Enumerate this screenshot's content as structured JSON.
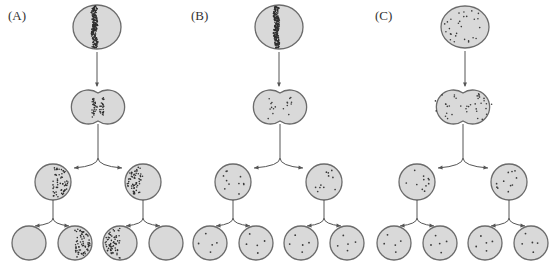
{
  "figure": {
    "panels": [
      {
        "label": "(A)",
        "label_pos": [
          8,
          20
        ],
        "distribution": "concentrated band that stays asymmetric",
        "top_cell": {
          "cx": 97,
          "cy": 27,
          "rx": 24,
          "ry": 22,
          "pattern": "vertical-band"
        },
        "dividing_cell": {
          "cx": 98,
          "cy": 107,
          "lobe_offset": 15,
          "r": 17,
          "pattern": "center-band-scattered"
        },
        "row3": [
          {
            "cx": 53,
            "cy": 182,
            "r": 18,
            "pattern": "right-half-dense"
          },
          {
            "cx": 143,
            "cy": 182,
            "r": 18,
            "pattern": "left-half-dense"
          }
        ],
        "row4": [
          {
            "cx": 29,
            "cy": 243,
            "r": 17,
            "pattern": "empty"
          },
          {
            "cx": 75,
            "cy": 243,
            "r": 17,
            "pattern": "right-half-dense"
          },
          {
            "cx": 120,
            "cy": 243,
            "r": 17,
            "pattern": "left-half-dense"
          },
          {
            "cx": 166,
            "cy": 243,
            "r": 17,
            "pattern": "empty"
          }
        ]
      },
      {
        "label": "(B)",
        "label_pos": [
          191,
          20
        ],
        "distribution": "band that disperses evenly",
        "top_cell": {
          "cx": 279,
          "cy": 27,
          "rx": 24,
          "ry": 22,
          "pattern": "vertical-band"
        },
        "dividing_cell": {
          "cx": 280,
          "cy": 107,
          "lobe_offset": 15,
          "r": 17,
          "pattern": "center-sparse"
        },
        "row3": [
          {
            "cx": 233,
            "cy": 182,
            "r": 18,
            "pattern": "sparse"
          },
          {
            "cx": 324,
            "cy": 182,
            "r": 18,
            "pattern": "sparse"
          }
        ],
        "row4": [
          {
            "cx": 210,
            "cy": 243,
            "r": 17,
            "pattern": "few"
          },
          {
            "cx": 256,
            "cy": 243,
            "r": 17,
            "pattern": "few"
          },
          {
            "cx": 301,
            "cy": 243,
            "r": 17,
            "pattern": "few"
          },
          {
            "cx": 347,
            "cy": 243,
            "r": 17,
            "pattern": "few"
          }
        ]
      },
      {
        "label": "(C)",
        "label_pos": [
          375,
          20
        ],
        "distribution": "uniformly scattered",
        "top_cell": {
          "cx": 465,
          "cy": 27,
          "rx": 24,
          "ry": 21,
          "pattern": "scattered"
        },
        "dividing_cell": {
          "cx": 463,
          "cy": 107,
          "lobe_offset": 15,
          "r": 17,
          "pattern": "scattered"
        },
        "row3": [
          {
            "cx": 417,
            "cy": 182,
            "r": 18,
            "pattern": "sparse"
          },
          {
            "cx": 509,
            "cy": 182,
            "r": 18,
            "pattern": "sparse"
          }
        ],
        "row4": [
          {
            "cx": 394,
            "cy": 243,
            "r": 17,
            "pattern": "few"
          },
          {
            "cx": 440,
            "cy": 243,
            "r": 17,
            "pattern": "few"
          },
          {
            "cx": 485,
            "cy": 243,
            "r": 17,
            "pattern": "few"
          },
          {
            "cx": 531,
            "cy": 243,
            "r": 17,
            "pattern": "few"
          }
        ]
      }
    ],
    "colors": {
      "cell_fill": "#d9d9d9",
      "cell_stroke": "#6b6b6b",
      "dot": "#3a3a3a",
      "arrow": "#555555"
    }
  }
}
